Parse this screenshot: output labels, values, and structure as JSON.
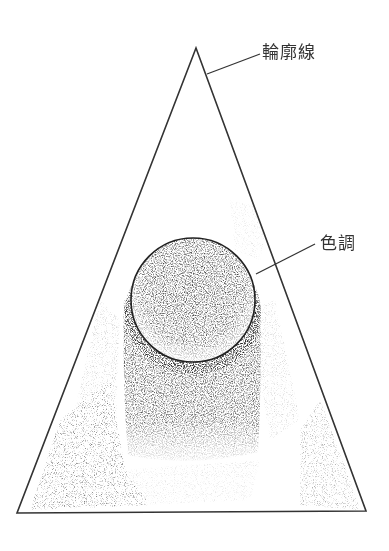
{
  "diagram": {
    "labels": {
      "outline": "輪廓線",
      "tone": "色調"
    },
    "colors": {
      "line": "#333333",
      "shade": "#2a2a2a",
      "background": "#ffffff"
    },
    "shapes": {
      "triangle": {
        "apex": [
          196,
          48
        ],
        "base_left": [
          17,
          513
        ],
        "base_right": [
          366,
          511
        ]
      },
      "circle": {
        "cx": 193,
        "cy": 300,
        "r": 63
      },
      "shadow_column": {
        "x": 124,
        "y": 290,
        "width": 136,
        "height": 170
      }
    }
  }
}
